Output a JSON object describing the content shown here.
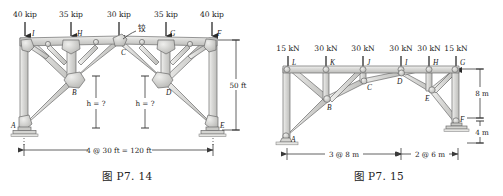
{
  "page": {
    "background": "#ffffff",
    "member_fill": "#d8d8d6",
    "member_stroke": "#6b6b6b",
    "gusset_fill": "#c9c9c7",
    "line_color": "#4a4a4a"
  },
  "figures": [
    {
      "id": "fig-left",
      "caption": "图 P7. 14",
      "loads": [
        {
          "label": "40 kip",
          "node": "I"
        },
        {
          "label": "35 kip",
          "node": "H"
        },
        {
          "label": "30 kip",
          "node": "C"
        },
        {
          "label": "35 kip",
          "node": "G"
        },
        {
          "label": "40 kip",
          "node": "F"
        }
      ],
      "nodes": [
        "A",
        "B",
        "C",
        "D",
        "E",
        "F",
        "G",
        "H",
        "I"
      ],
      "annotations": [
        {
          "name": "hinge-annotation",
          "text": "铰"
        },
        {
          "name": "height-unknown-left",
          "text": "h = ?"
        },
        {
          "name": "height-unknown-right",
          "text": "h = ?"
        }
      ],
      "dimensions": [
        {
          "name": "span-dimension",
          "text": "4 @ 30 ft = 120 ft",
          "orientation": "horizontal"
        },
        {
          "name": "column-height-dimension",
          "text": "50 ft",
          "orientation": "vertical"
        }
      ],
      "supports": [
        {
          "node": "A",
          "type": "pin-base-plate"
        },
        {
          "node": "E",
          "type": "pin-base-plate"
        }
      ]
    },
    {
      "id": "fig-right",
      "caption": "图 P7. 15",
      "loads": [
        {
          "label": "15 kN",
          "node": "L"
        },
        {
          "label": "30 kN",
          "node": "K"
        },
        {
          "label": "30 kN",
          "node": "J"
        },
        {
          "label": "30 kN",
          "node": "I"
        },
        {
          "label": "30 kN",
          "node": "H"
        },
        {
          "label": "15 kN",
          "node": "G"
        }
      ],
      "nodes": [
        "A",
        "B",
        "C",
        "D",
        "E",
        "F",
        "G",
        "H",
        "I",
        "J",
        "K",
        "L"
      ],
      "annotations": [],
      "dimensions": [
        {
          "name": "left-span-dimension",
          "text": "3 @ 8 m",
          "orientation": "horizontal"
        },
        {
          "name": "right-span-dimension",
          "text": "2 @ 6 m",
          "orientation": "horizontal"
        },
        {
          "name": "upper-height-dimension",
          "text": "8 m",
          "orientation": "vertical"
        },
        {
          "name": "lower-height-dimension",
          "text": "4 m",
          "orientation": "vertical"
        }
      ],
      "supports": [
        {
          "node": "A",
          "type": "pin-roller"
        },
        {
          "node": "F",
          "type": "pin-base-plate"
        }
      ]
    }
  ]
}
